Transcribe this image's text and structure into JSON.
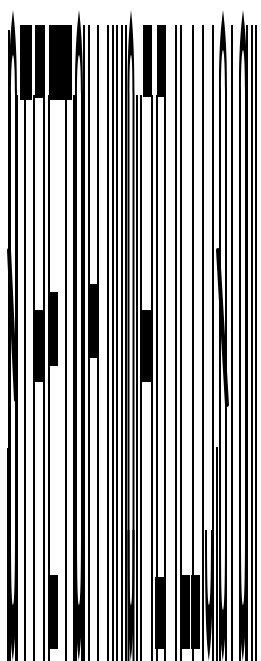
{
  "canvas": {
    "width": 261,
    "height": 661,
    "background": "#ffffff",
    "ink": "#000000"
  },
  "lines": [
    {
      "x": 9,
      "y1": 30,
      "y2": 661,
      "w": 2
    },
    {
      "x": 17,
      "y1": 95,
      "y2": 661,
      "w": 2
    },
    {
      "x": 25,
      "y1": 95,
      "y2": 661,
      "w": 2
    },
    {
      "x": 34,
      "y1": 95,
      "y2": 661,
      "w": 2
    },
    {
      "x": 44,
      "y1": 95,
      "y2": 661,
      "w": 2
    },
    {
      "x": 49,
      "y1": 95,
      "y2": 661,
      "w": 2
    },
    {
      "x": 66,
      "y1": 95,
      "y2": 661,
      "w": 2
    },
    {
      "x": 74,
      "y1": 95,
      "y2": 661,
      "w": 2
    },
    {
      "x": 84,
      "y1": 25,
      "y2": 661,
      "w": 2
    },
    {
      "x": 89,
      "y1": 25,
      "y2": 661,
      "w": 2
    },
    {
      "x": 98,
      "y1": 25,
      "y2": 661,
      "w": 2
    },
    {
      "x": 108,
      "y1": 25,
      "y2": 661,
      "w": 2
    },
    {
      "x": 113,
      "y1": 25,
      "y2": 661,
      "w": 2
    },
    {
      "x": 117,
      "y1": 25,
      "y2": 661,
      "w": 2
    },
    {
      "x": 122,
      "y1": 25,
      "y2": 661,
      "w": 2
    },
    {
      "x": 126,
      "y1": 25,
      "y2": 661,
      "w": 2
    },
    {
      "x": 137,
      "y1": 95,
      "y2": 661,
      "w": 2
    },
    {
      "x": 141,
      "y1": 95,
      "y2": 661,
      "w": 2
    },
    {
      "x": 152,
      "y1": 95,
      "y2": 661,
      "w": 2
    },
    {
      "x": 157,
      "y1": 95,
      "y2": 661,
      "w": 2
    },
    {
      "x": 165,
      "y1": 95,
      "y2": 661,
      "w": 2
    },
    {
      "x": 176,
      "y1": 25,
      "y2": 661,
      "w": 2
    },
    {
      "x": 181,
      "y1": 25,
      "y2": 661,
      "w": 2
    },
    {
      "x": 193,
      "y1": 25,
      "y2": 661,
      "w": 2
    },
    {
      "x": 203,
      "y1": 25,
      "y2": 661,
      "w": 2
    },
    {
      "x": 213,
      "y1": 25,
      "y2": 661,
      "w": 2
    },
    {
      "x": 232,
      "y1": 25,
      "y2": 661,
      "w": 2
    },
    {
      "x": 247,
      "y1": 25,
      "y2": 661,
      "w": 2
    },
    {
      "x": 252,
      "y1": 25,
      "y2": 661,
      "w": 2
    },
    {
      "x": 256,
      "y1": 25,
      "y2": 661,
      "w": 2
    },
    {
      "x": 8,
      "y1": 448,
      "y2": 661,
      "w": 2
    },
    {
      "x": 217,
      "y1": 447,
      "y2": 661,
      "w": 2
    }
  ],
  "blocks": [
    {
      "x": 20,
      "y": 25,
      "w": 12,
      "h": 75
    },
    {
      "x": 35,
      "y": 25,
      "w": 10,
      "h": 73
    },
    {
      "x": 49,
      "y": 25,
      "w": 11,
      "h": 75
    },
    {
      "x": 60,
      "y": 25,
      "w": 12,
      "h": 75
    },
    {
      "x": 143,
      "y": 25,
      "w": 9,
      "h": 72
    },
    {
      "x": 157,
      "y": 25,
      "w": 9,
      "h": 72
    },
    {
      "x": 34,
      "y": 310,
      "w": 9,
      "h": 72
    },
    {
      "x": 49,
      "y": 292,
      "w": 9,
      "h": 74
    },
    {
      "x": 89,
      "y": 284,
      "w": 10,
      "h": 74
    },
    {
      "x": 142,
      "y": 310,
      "w": 9,
      "h": 72
    },
    {
      "x": 48,
      "y": 575,
      "w": 10,
      "h": 74
    },
    {
      "x": 181,
      "y": 575,
      "w": 9,
      "h": 74
    },
    {
      "x": 191,
      "y": 575,
      "w": 9,
      "h": 74
    },
    {
      "x": 155,
      "y": 577,
      "w": 9,
      "h": 72
    }
  ],
  "spikes_up": [
    {
      "x": 13,
      "top": 10,
      "base": 95,
      "w": 8
    },
    {
      "x": 79,
      "top": 10,
      "base": 95,
      "w": 8
    },
    {
      "x": 131,
      "top": 10,
      "base": 95,
      "w": 7
    },
    {
      "x": 223,
      "top": 10,
      "base": 90,
      "w": 8
    },
    {
      "x": 243,
      "top": 10,
      "base": 90,
      "w": 8
    }
  ],
  "spikes_down": [
    {
      "x": 13,
      "top": 590,
      "base": 661,
      "w": 8
    },
    {
      "x": 79,
      "top": 590,
      "base": 661,
      "w": 8
    },
    {
      "x": 131,
      "top": 590,
      "base": 661,
      "w": 7
    },
    {
      "x": 209,
      "top": 590,
      "base": 661,
      "w": 8
    },
    {
      "x": 223,
      "top": 595,
      "base": 661,
      "w": 8
    },
    {
      "x": 243,
      "top": 590,
      "base": 661,
      "w": 8
    }
  ],
  "diagonals": [
    {
      "x1": 9,
      "y1": 250,
      "x2": 16,
      "y2": 400,
      "w": 4
    },
    {
      "x1": 218,
      "y1": 250,
      "x2": 227,
      "y2": 405,
      "w": 4
    }
  ]
}
